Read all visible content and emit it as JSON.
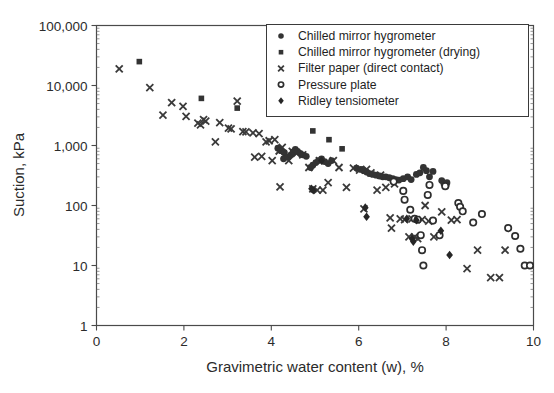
{
  "figure": {
    "background_color": "#ffffff",
    "ink_color": "#333333"
  },
  "chart_data": {
    "type": "scatter",
    "title": "",
    "xlabel": "Gravimetric water content (w), %",
    "ylabel": "Suction, kPa",
    "xlim": [
      0,
      10
    ],
    "ylim": [
      1,
      100000
    ],
    "xscale": "linear",
    "yscale": "log",
    "grid": true,
    "grid_style": "dotted minor and major log grid",
    "legend_position": "top-right inside",
    "xticks": [
      0,
      2,
      4,
      6,
      8,
      10
    ],
    "xtick_labels": [
      "0",
      "2",
      "4",
      "6",
      "8",
      "10"
    ],
    "yticks": [
      1,
      10,
      100,
      1000,
      10000,
      100000
    ],
    "ytick_labels": [
      "1",
      "10",
      "100",
      "1,000",
      "10,000",
      "100,000"
    ],
    "series": [
      {
        "name": "Chilled mirror hygrometer",
        "marker": "filled-circle",
        "color": "#333333",
        "points": [
          [
            4.15,
            900
          ],
          [
            4.22,
            820
          ],
          [
            4.3,
            760
          ],
          [
            4.28,
            600
          ],
          [
            4.38,
            640
          ],
          [
            4.45,
            700
          ],
          [
            4.5,
            780
          ],
          [
            4.55,
            860
          ],
          [
            4.6,
            800
          ],
          [
            4.66,
            740
          ],
          [
            4.72,
            700
          ],
          [
            4.8,
            660
          ],
          [
            4.9,
            430
          ],
          [
            4.95,
            470
          ],
          [
            5.02,
            520
          ],
          [
            5.08,
            560
          ],
          [
            5.15,
            600
          ],
          [
            5.22,
            540
          ],
          [
            5.3,
            500
          ],
          [
            5.38,
            560
          ],
          [
            5.95,
            420
          ],
          [
            6.05,
            400
          ],
          [
            6.12,
            380
          ],
          [
            6.18,
            360
          ],
          [
            6.25,
            340
          ],
          [
            6.32,
            330
          ],
          [
            6.4,
            320
          ],
          [
            6.48,
            310
          ],
          [
            6.55,
            300
          ],
          [
            6.62,
            300
          ],
          [
            6.7,
            290
          ],
          [
            6.78,
            280
          ],
          [
            6.85,
            270
          ],
          [
            6.92,
            265
          ],
          [
            7.02,
            280
          ],
          [
            7.12,
            300
          ],
          [
            7.2,
            270
          ],
          [
            7.32,
            330
          ],
          [
            7.4,
            350
          ],
          [
            7.48,
            430
          ],
          [
            7.55,
            380
          ],
          [
            7.62,
            300
          ],
          [
            7.7,
            370
          ],
          [
            7.9,
            260
          ],
          [
            7.95,
            230
          ],
          [
            8.0,
            215
          ],
          [
            8.02,
            240
          ]
        ]
      },
      {
        "name": "Chilled mirror hygrometer (drying)",
        "marker": "filled-square",
        "color": "#333333",
        "points": [
          [
            0.98,
            25000
          ],
          [
            2.4,
            6100
          ],
          [
            3.22,
            4200
          ],
          [
            4.95,
            1750
          ],
          [
            5.32,
            1250
          ],
          [
            5.62,
            880
          ]
        ]
      },
      {
        "name": "Filter paper (direct contact)",
        "marker": "cross",
        "color": "#3a3a3a",
        "points": [
          [
            0.52,
            19000
          ],
          [
            1.22,
            9200
          ],
          [
            1.52,
            3200
          ],
          [
            1.72,
            5200
          ],
          [
            1.98,
            4500
          ],
          [
            2.05,
            3050
          ],
          [
            2.32,
            2350
          ],
          [
            2.38,
            2200
          ],
          [
            2.45,
            2700
          ],
          [
            2.5,
            2550
          ],
          [
            2.72,
            1150
          ],
          [
            2.82,
            2400
          ],
          [
            3.02,
            1950
          ],
          [
            3.08,
            1900
          ],
          [
            3.22,
            5500
          ],
          [
            3.35,
            1700
          ],
          [
            3.42,
            1680
          ],
          [
            3.58,
            1620
          ],
          [
            3.62,
            640
          ],
          [
            3.72,
            1580
          ],
          [
            3.78,
            660
          ],
          [
            3.88,
            1150
          ],
          [
            3.95,
            1200
          ],
          [
            4.02,
            560
          ],
          [
            4.08,
            1250
          ],
          [
            4.18,
            810
          ],
          [
            4.2,
            205
          ],
          [
            4.25,
            930
          ],
          [
            4.4,
            560
          ],
          [
            4.48,
            800
          ],
          [
            4.58,
            740
          ],
          [
            4.72,
            700
          ],
          [
            4.86,
            430
          ],
          [
            4.95,
            190
          ],
          [
            5.05,
            180
          ],
          [
            5.1,
            560
          ],
          [
            5.18,
            180
          ],
          [
            5.3,
            240
          ],
          [
            5.42,
            560
          ],
          [
            5.55,
            430
          ],
          [
            5.72,
            200
          ],
          [
            5.88,
            420
          ],
          [
            6.02,
            390
          ],
          [
            6.12,
            88
          ],
          [
            6.18,
            400
          ],
          [
            6.28,
            350
          ],
          [
            6.42,
            180
          ],
          [
            6.5,
            320
          ],
          [
            6.62,
            200
          ],
          [
            6.72,
            62
          ],
          [
            6.75,
            42
          ],
          [
            6.82,
            230
          ],
          [
            6.95,
            60
          ],
          [
            7.05,
            58
          ],
          [
            7.15,
            30
          ],
          [
            7.22,
            60
          ],
          [
            7.28,
            30
          ],
          [
            7.35,
            28
          ],
          [
            7.45,
            58
          ],
          [
            7.52,
            100
          ],
          [
            7.6,
            55
          ],
          [
            7.72,
            30
          ],
          [
            7.9,
            78
          ],
          [
            8.12,
            57
          ],
          [
            8.25,
            58
          ],
          [
            8.48,
            8.9
          ],
          [
            8.72,
            18
          ],
          [
            9.02,
            6.3
          ],
          [
            9.22,
            6.3
          ],
          [
            9.35,
            18
          ]
        ]
      },
      {
        "name": "Pressure plate",
        "marker": "open-circle",
        "color": "#2e2e2e",
        "points": [
          [
            6.8,
            250
          ],
          [
            7.02,
            175
          ],
          [
            7.05,
            125
          ],
          [
            7.18,
            85
          ],
          [
            7.28,
            60
          ],
          [
            7.35,
            58
          ],
          [
            7.42,
            32
          ],
          [
            7.45,
            18
          ],
          [
            7.48,
            10
          ],
          [
            7.58,
            150
          ],
          [
            7.62,
            220
          ],
          [
            7.7,
            56
          ],
          [
            7.85,
            32
          ],
          [
            7.98,
            210
          ],
          [
            8.28,
            110
          ],
          [
            8.32,
            95
          ],
          [
            8.38,
            80
          ],
          [
            8.62,
            52
          ],
          [
            8.82,
            72
          ],
          [
            9.42,
            42
          ],
          [
            9.58,
            31
          ],
          [
            9.7,
            19
          ],
          [
            9.8,
            10
          ],
          [
            9.92,
            10
          ]
        ]
      },
      {
        "name": "Ridley tensiometer",
        "marker": "filled-diamond",
        "color": "#262626",
        "points": [
          [
            4.92,
            190
          ],
          [
            4.96,
            180
          ],
          [
            5.15,
            560
          ],
          [
            6.15,
            92
          ],
          [
            6.18,
            65
          ],
          [
            7.1,
            60
          ],
          [
            7.22,
            28
          ],
          [
            7.25,
            25
          ],
          [
            7.32,
            57
          ],
          [
            7.88,
            38
          ],
          [
            8.08,
            15
          ]
        ]
      }
    ]
  },
  "legend": {
    "entries": [
      {
        "label": "Chilled mirror hygrometer",
        "marker": "filled-circle"
      },
      {
        "label": "Chilled mirror hygrometer (drying)",
        "marker": "filled-square"
      },
      {
        "label": "Filter paper (direct contact)",
        "marker": "cross"
      },
      {
        "label": "Pressure plate",
        "marker": "open-circle"
      },
      {
        "label": "Ridley tensiometer",
        "marker": "filled-diamond"
      }
    ]
  }
}
